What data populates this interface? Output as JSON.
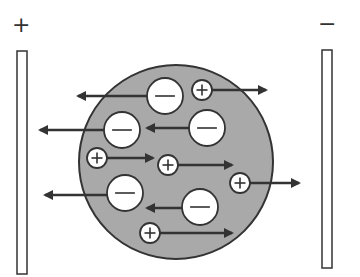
{
  "diagram": {
    "title": "",
    "width": 360,
    "height": 277,
    "colors": {
      "background": "#ffffff",
      "particle_fill": "#a9a9a9",
      "outline": "#333333",
      "ion_fill": "#ffffff",
      "arrow": "#333333"
    },
    "plates": [
      {
        "id": "anode",
        "sign_label": "+",
        "x": 17,
        "y": 51,
        "width": 10,
        "height": 223,
        "label_x": 20,
        "label_y": 27
      },
      {
        "id": "cathode",
        "sign_label": "−",
        "x": 322,
        "y": 50,
        "width": 10,
        "height": 218,
        "label_x": 326,
        "label_y": 26
      }
    ],
    "particle": {
      "cx": 176,
      "cy": 162,
      "r": 97
    },
    "ions": [
      {
        "sign": "−",
        "cx": 165,
        "cy": 96,
        "r": 18,
        "arrow_to_x": 78,
        "arrow_y": 96
      },
      {
        "sign": "+",
        "cx": 202,
        "cy": 90,
        "r": 10,
        "arrow_to_x": 266,
        "arrow_y": 90
      },
      {
        "sign": "−",
        "cx": 122,
        "cy": 130,
        "r": 18,
        "arrow_to_x": 40,
        "arrow_y": 130
      },
      {
        "sign": "−",
        "cx": 207,
        "cy": 128,
        "r": 18,
        "arrow_to_x": 147,
        "arrow_y": 128
      },
      {
        "sign": "+",
        "cx": 97,
        "cy": 158,
        "r": 10,
        "arrow_to_x": 153,
        "arrow_y": 158
      },
      {
        "sign": "+",
        "cx": 168,
        "cy": 165,
        "r": 10,
        "arrow_to_x": 232,
        "arrow_y": 165
      },
      {
        "sign": "+",
        "cx": 240,
        "cy": 183,
        "r": 10,
        "arrow_to_x": 299,
        "arrow_y": 183
      },
      {
        "sign": "−",
        "cx": 125,
        "cy": 193,
        "r": 18,
        "arrow_to_x": 45,
        "arrow_y": 195
      },
      {
        "sign": "−",
        "cx": 200,
        "cy": 207,
        "r": 18,
        "arrow_to_x": 147,
        "arrow_y": 208
      },
      {
        "sign": "+",
        "cx": 150,
        "cy": 233,
        "r": 10,
        "arrow_to_x": 232,
        "arrow_y": 233
      }
    ]
  }
}
